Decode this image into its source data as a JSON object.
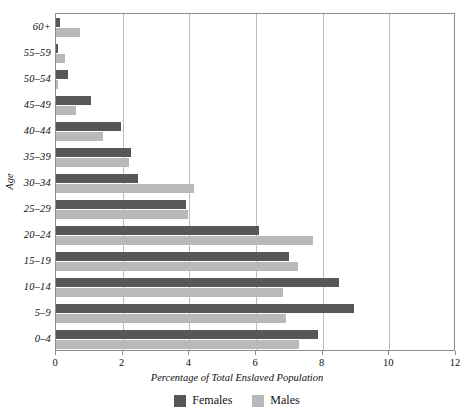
{
  "chart_data": {
    "type": "bar",
    "orientation": "horizontal",
    "title": "",
    "xlabel": "Percentage of Total Enslaved Population",
    "ylabel": "Age",
    "xlim": [
      0,
      12
    ],
    "xticks": [
      0,
      2,
      4,
      6,
      8,
      10,
      12
    ],
    "xtick_labels": [
      "0",
      "2",
      "4",
      "6",
      "8",
      "10",
      "12"
    ],
    "grid": "vertical",
    "legend_position": "bottom-center",
    "categories": [
      "0-4",
      "5-9",
      "10-14",
      "15-19",
      "20-24",
      "25-29",
      "30-34",
      "35-39",
      "40-44",
      "45-49",
      "50-54",
      "55-59",
      "60+"
    ],
    "category_labels": [
      "0–4",
      "5–9",
      "10–14",
      "15–19",
      "20–24",
      "25–29",
      "30–34",
      "35–39",
      "40–44",
      "45–49",
      "50–54",
      "55–59",
      "60+"
    ],
    "series": [
      {
        "name": "Females",
        "color": "#575757",
        "values": [
          7.85,
          8.95,
          8.5,
          7.0,
          6.1,
          3.9,
          2.45,
          2.25,
          1.95,
          1.05,
          0.37,
          0.07,
          0.13
        ]
      },
      {
        "name": "Males",
        "color": "#b9b9b9",
        "values": [
          7.3,
          6.9,
          6.8,
          7.25,
          7.7,
          3.95,
          4.15,
          2.2,
          1.4,
          0.6,
          0.05,
          0.28,
          0.73
        ]
      }
    ]
  },
  "legend": {
    "items": [
      {
        "label": "Females",
        "color": "#575757"
      },
      {
        "label": "Males",
        "color": "#b9b9b9"
      }
    ]
  },
  "axes": {
    "x_title": "Percentage of Total Enslaved Population",
    "y_title": "Age"
  }
}
